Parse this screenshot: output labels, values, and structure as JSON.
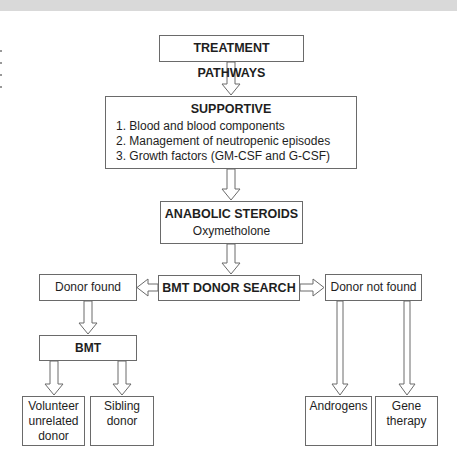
{
  "diagram": {
    "title": "TREATMENT PATHWAYS",
    "supportive": {
      "heading": "SUPPORTIVE",
      "items": [
        "1. Blood and blood components",
        "2. Management of neutropenic episodes",
        "3. Growth factors (GM-CSF and G-CSF)"
      ]
    },
    "anabolic": {
      "heading": "ANABOLIC STEROIDS",
      "sub": "Oxymetholone"
    },
    "donor_search": "BMT DONOR SEARCH",
    "donor_found": "Donor found",
    "donor_not_found": "Donor not found",
    "bmt": "BMT",
    "leaves": {
      "volunteer": [
        "Volunteer",
        "unrelated",
        "donor"
      ],
      "sibling": [
        "Sibling",
        "donor"
      ],
      "androgens": [
        "Androgens"
      ],
      "gene": [
        "Gene",
        "therapy"
      ]
    },
    "colors": {
      "stroke": "#6a6a6a",
      "text": "#1e1e1e",
      "band": "#d9d9d9"
    }
  }
}
